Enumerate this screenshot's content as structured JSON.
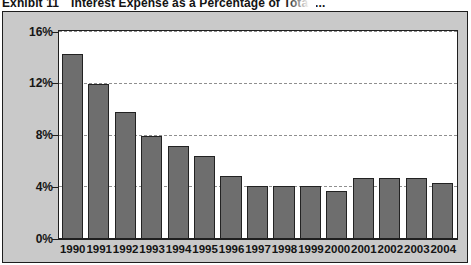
{
  "exhibit": {
    "label": "Exhibit 11",
    "title": "Interest Expense as a Percentage of Total ..."
  },
  "colors": {
    "bar_fill": "#6e6e6e",
    "bar_border": "#222222",
    "panel_bg": "#ffffff",
    "figure_bg": "#c9c9c9",
    "frame": "#1d1d1d",
    "gridline": "#8f8f8f",
    "text": "#141414"
  },
  "chart_data": {
    "type": "bar",
    "title": "Interest Expense as a Percentage of Total ...",
    "xlabel": "",
    "ylabel": "",
    "ylim": [
      0,
      16
    ],
    "yticks": [
      0,
      4,
      8,
      12,
      16
    ],
    "ytick_labels": [
      "0%",
      "4%",
      "8%",
      "12%",
      "16%"
    ],
    "grid": true,
    "legend": "none",
    "categories": [
      "1990",
      "1991",
      "1992",
      "1993",
      "1994",
      "1995",
      "1996",
      "1997",
      "1998",
      "1999",
      "2000",
      "2001",
      "2002",
      "2003",
      "2004"
    ],
    "values": [
      14.3,
      12.0,
      9.8,
      8.0,
      7.2,
      6.4,
      4.9,
      4.1,
      4.1,
      4.1,
      3.7,
      4.7,
      4.7,
      4.7,
      4.3
    ]
  }
}
